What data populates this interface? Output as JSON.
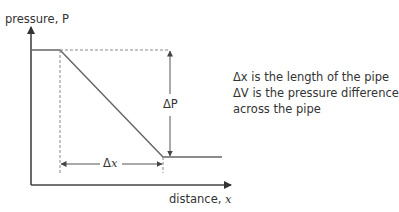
{
  "axes": {
    "y_label": "pressure, P",
    "x_label_prefix": "distance, ",
    "x_label_var": "x"
  },
  "annotations": {
    "delta_p": "ΔP",
    "delta_x_prefix": "Δ",
    "delta_x_var": "x"
  },
  "notes": {
    "line1_sym": "Δx",
    "line1_text": " is the length of the pipe",
    "line2": "ΔV is the pressure difference",
    "line3": "across the pipe"
  },
  "colors": {
    "line": "#555555",
    "dash": "#777777",
    "text": "#333333"
  }
}
